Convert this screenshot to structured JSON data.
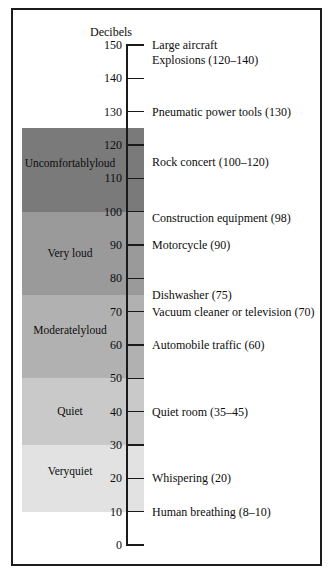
{
  "figure": {
    "axis_title": "Decibels",
    "border_color": "#1c1c1c"
  },
  "chart_data": {
    "type": "bar",
    "title": "Decibels",
    "xlabel": "",
    "ylabel": "Decibels",
    "ylim": [
      0,
      150
    ],
    "grid": false,
    "legend_position": "none",
    "tick_labels": [
      "150",
      "140",
      "130",
      "120",
      "110",
      "100",
      "90",
      "80",
      "70",
      "60",
      "50",
      "40",
      "30",
      "20",
      "10",
      "0"
    ],
    "tick_values": [
      150,
      140,
      130,
      120,
      110,
      100,
      90,
      80,
      70,
      60,
      50,
      40,
      30,
      20,
      10,
      0
    ],
    "bands": [
      {
        "label": "Uncomfortably loud",
        "label_line1": "Uncomfortably",
        "label_line2": "loud",
        "min": 100,
        "max": 125,
        "color": "#7a7a7a"
      },
      {
        "label": "Very loud",
        "label_line1": "Very loud",
        "label_line2": "",
        "min": 75,
        "max": 100,
        "color": "#9a9a9a"
      },
      {
        "label": "Moderately loud",
        "label_line1": "Moderately",
        "label_line2": "loud",
        "min": 50,
        "max": 75,
        "color": "#b1b1b1"
      },
      {
        "label": "Quiet",
        "label_line1": "Quiet",
        "label_line2": "",
        "min": 30,
        "max": 50,
        "color": "#c9c9c9"
      },
      {
        "label": "Very quiet",
        "label_line1": "Very",
        "label_line2": "quiet",
        "min": 10,
        "max": 30,
        "color": "#e2e2e2"
      }
    ],
    "annotations": [
      {
        "lines": [
          "Large aircraft",
          "Explosions (120–140)"
        ],
        "value": 150,
        "range": [
          120,
          140
        ]
      },
      {
        "lines": [
          "Pneumatic power tools (130)"
        ],
        "value": 130,
        "range": [
          130,
          130
        ]
      },
      {
        "lines": [
          "Rock concert (100–120)"
        ],
        "value": 115,
        "range": [
          100,
          120
        ]
      },
      {
        "lines": [
          "Construction equipment (98)"
        ],
        "value": 98,
        "range": [
          98,
          98
        ]
      },
      {
        "lines": [
          "Motorcycle (90)"
        ],
        "value": 90,
        "range": [
          90,
          90
        ]
      },
      {
        "lines": [
          "Dishwasher (75)"
        ],
        "value": 75,
        "range": [
          75,
          75
        ]
      },
      {
        "lines": [
          "Vacuum cleaner or television (70)"
        ],
        "value": 70,
        "range": [
          70,
          70
        ]
      },
      {
        "lines": [
          "Automobile traffic (60)"
        ],
        "value": 60,
        "range": [
          60,
          60
        ]
      },
      {
        "lines": [
          "Quiet room (35–45)"
        ],
        "value": 40,
        "range": [
          35,
          45
        ]
      },
      {
        "lines": [
          "Whispering (20)"
        ],
        "value": 20,
        "range": [
          20,
          20
        ]
      },
      {
        "lines": [
          "Human breathing (8–10)"
        ],
        "value": 10,
        "range": [
          8,
          10
        ]
      }
    ]
  }
}
